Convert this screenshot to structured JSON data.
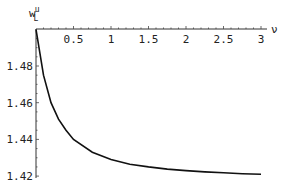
{
  "chart_data": {
    "type": "line",
    "title": "",
    "xlabel": "ν",
    "ylabel": "w_L^u",
    "ylabel_main": "w",
    "ylabel_sub": "L",
    "ylabel_sup": "u",
    "xlim": [
      0,
      3.05
    ],
    "ylim": [
      1.419,
      1.5
    ],
    "xticks": [
      "0.5",
      "1",
      "1.5",
      "2",
      "2.5",
      "3"
    ],
    "yticks": [
      "1.48",
      "1.46",
      "1.44",
      "1.42"
    ],
    "grid": false,
    "legend": null,
    "series": [
      {
        "name": "w_L^u(ν)",
        "x": [
          0,
          0.1,
          0.2,
          0.3,
          0.4,
          0.5,
          0.75,
          1.0,
          1.25,
          1.5,
          1.75,
          2.0,
          2.25,
          2.5,
          2.75,
          3.0
        ],
        "y": [
          1.5,
          1.475,
          1.46,
          1.451,
          1.445,
          1.44,
          1.433,
          1.429,
          1.4265,
          1.425,
          1.4238,
          1.423,
          1.4223,
          1.4218,
          1.4213,
          1.421
        ]
      }
    ]
  }
}
